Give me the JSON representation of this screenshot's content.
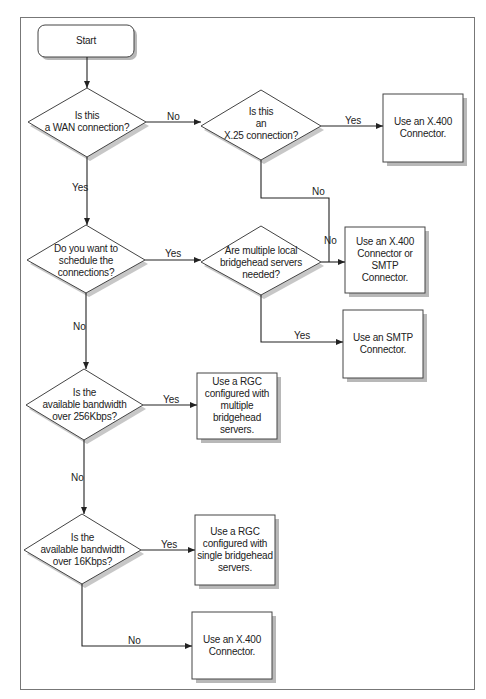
{
  "diagram": {
    "type": "flowchart",
    "start": {
      "label": "Start"
    },
    "decisions": [
      {
        "id": "d1",
        "label": "Is this\na WAN connection?"
      },
      {
        "id": "d2",
        "label": "Is this\nan\nX.25 connection?"
      },
      {
        "id": "d3",
        "label": "Do you want to\nschedule the\nconnections?"
      },
      {
        "id": "d4",
        "label": "Are multiple local\nbridgehead servers\nneeded?"
      },
      {
        "id": "d5",
        "label": "Is the\navailable bandwidth\nover 256Kbps?"
      },
      {
        "id": "d6",
        "label": "Is the\navailable bandwidth\nover 16Kbps?"
      }
    ],
    "outcomes": [
      {
        "id": "o1",
        "label": "Use an X.400\nConnector."
      },
      {
        "id": "o2",
        "label": "Use an X.400\nConnector or SMTP\nConnector."
      },
      {
        "id": "o3",
        "label": "Use an SMTP\nConnector."
      },
      {
        "id": "o4",
        "label": "Use a RGC\nconfigured with\nmultiple\nbridgehead servers."
      },
      {
        "id": "o5",
        "label": "Use a RGC\nconfigured with\nsingle bridgehead\nservers."
      },
      {
        "id": "o6",
        "label": "Use an X.400\nConnector."
      }
    ],
    "edges": [
      {
        "from": "start",
        "to": "d1",
        "label": ""
      },
      {
        "from": "d1",
        "to": "d2",
        "label": "No"
      },
      {
        "from": "d1",
        "to": "d3",
        "label": "Yes"
      },
      {
        "from": "d2",
        "to": "o1",
        "label": "Yes"
      },
      {
        "from": "d2",
        "to": "o2",
        "label": "No"
      },
      {
        "from": "d3",
        "to": "d4",
        "label": "Yes"
      },
      {
        "from": "d3",
        "to": "d5",
        "label": "No"
      },
      {
        "from": "d4",
        "to": "o2",
        "label": "No"
      },
      {
        "from": "d4",
        "to": "o3",
        "label": "Yes"
      },
      {
        "from": "d5",
        "to": "o4",
        "label": "Yes"
      },
      {
        "from": "d5",
        "to": "d6",
        "label": "No"
      },
      {
        "from": "d6",
        "to": "o5",
        "label": "Yes"
      },
      {
        "from": "d6",
        "to": "o6",
        "label": "No"
      }
    ],
    "edge_labels": {
      "d1_no": "No",
      "d1_yes": "Yes",
      "d2_yes": "Yes",
      "d2_no": "No",
      "d4_no": "No",
      "d3_yes": "Yes",
      "d3_no": "No",
      "d4_yes": "Yes",
      "d5_yes": "Yes",
      "d5_no": "No",
      "d6_yes": "Yes",
      "d6_no": "No"
    }
  }
}
